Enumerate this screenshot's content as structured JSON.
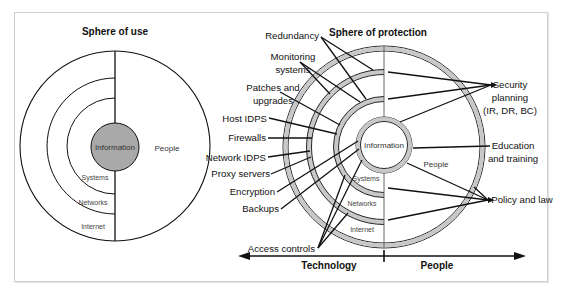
{
  "left_panel": {
    "title": "Sphere of use",
    "center_label": "Information",
    "right_label": "People",
    "layers": [
      "Systems",
      "Networks",
      "Internet"
    ]
  },
  "right_panel": {
    "title": "Sphere of protection",
    "center_label": "Information",
    "right_label": "People",
    "layers": [
      "Systems",
      "Networks",
      "Internet"
    ],
    "technology_controls": [
      "Redundancy",
      "Monitoring systems",
      "Patches and upgrades",
      "Host IDPS",
      "Firewalls",
      "Network IDPS",
      "Proxy servers",
      "Encryption",
      "Backups",
      "Access controls"
    ],
    "people_controls": [
      "Security planning (IR, DR, BC)",
      "Education and training",
      "Policy and law"
    ],
    "labels": {
      "redundancy": "Redundancy",
      "monitoring_1": "Monitoring",
      "monitoring_2": "systems",
      "patches_1": "Patches and",
      "patches_2": "upgrades",
      "host_idps": "Host IDPS",
      "firewalls": "Firewalls",
      "network_idps": "Network IDPS",
      "proxy": "Proxy servers",
      "encryption": "Encryption",
      "backups": "Backups",
      "access": "Access controls",
      "secplan_1": "Security",
      "secplan_2": "planning",
      "secplan_3": "(IR, DR, BC)",
      "edu_1": "Education",
      "edu_2": "and training",
      "policy": "Policy and law"
    },
    "axis": {
      "left_label": "Technology",
      "right_label": "People"
    }
  },
  "colors": {
    "ring_fill": "#c8c8c8",
    "info_fill": "#a9a9a9",
    "line": "#111111"
  }
}
